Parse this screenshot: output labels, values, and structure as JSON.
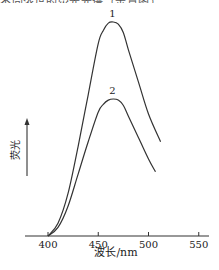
{
  "header": {
    "cutoff_text": "不同浓度的荧光光谱（示意图）"
  },
  "chart_data": {
    "type": "line",
    "title": "",
    "xlabel": "波长/nm",
    "ylabel": "荧光",
    "ylabel_has_arrow": true,
    "x_ticks": [
      400,
      450,
      500,
      550
    ],
    "x_tick_labels": [
      "400",
      "450",
      "500",
      "550"
    ],
    "xlim": [
      377,
      560
    ],
    "ylim": [
      0,
      1.0
    ],
    "y_ticks": [],
    "grid": false,
    "legend": "inline curve labels",
    "series": [
      {
        "name": "1",
        "label": "1",
        "x": [
          400,
          410,
          420,
          430,
          440,
          450,
          455,
          460,
          465,
          470,
          475,
          480,
          490,
          500,
          512
        ],
        "y": [
          0.0,
          0.06,
          0.2,
          0.42,
          0.66,
          0.9,
          0.96,
          0.995,
          1.0,
          0.99,
          0.95,
          0.87,
          0.72,
          0.57,
          0.44
        ]
      },
      {
        "name": "2",
        "label": "2",
        "x": [
          400,
          410,
          420,
          430,
          440,
          450,
          455,
          460,
          465,
          470,
          475,
          480,
          490,
          500,
          507
        ],
        "y": [
          0.0,
          0.04,
          0.14,
          0.29,
          0.44,
          0.58,
          0.615,
          0.635,
          0.64,
          0.635,
          0.61,
          0.56,
          0.46,
          0.36,
          0.3
        ]
      }
    ]
  },
  "colors": {
    "line": "#333333",
    "axis": "#333333",
    "text": "#222222"
  }
}
